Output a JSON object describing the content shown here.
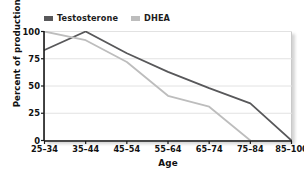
{
  "chart_data": {
    "type": "line",
    "title": "",
    "xlabel": "Age",
    "ylabel": "Percent of production in men",
    "categories": [
      "25–34",
      "35–44",
      "45–54",
      "55–64",
      "65–74",
      "75–84",
      "85–100"
    ],
    "yticks": [
      0,
      25,
      50,
      75,
      100
    ],
    "ylim": [
      0,
      100
    ],
    "grid": true,
    "legend_position": "top-left",
    "series": [
      {
        "name": "Testosterone",
        "color": "#58585a",
        "values": [
          83,
          100,
          80,
          63,
          48,
          34,
          0
        ]
      },
      {
        "name": "DHEA",
        "color": "#bdbdbd",
        "values": [
          100,
          92,
          72,
          41,
          31,
          0,
          null
        ]
      }
    ]
  },
  "legend": {
    "items": [
      {
        "label": "Testosterone",
        "swatch_icon": "legend-swatch-icon"
      },
      {
        "label": "DHEA",
        "swatch_icon": "legend-swatch-icon"
      }
    ]
  },
  "axes": {
    "y_title": "Percent of production in men",
    "x_title": "Age",
    "y_tick_labels": [
      "100",
      "75",
      "50",
      "25",
      "0"
    ],
    "x_tick_labels": [
      "25–34",
      "35–44",
      "45–54",
      "55–64",
      "65–74",
      "75–84",
      "85–100"
    ]
  },
  "colors": {
    "testosterone": "#58585a",
    "dhea": "#bdbdbd",
    "grid": "#e2e2e2",
    "frame": "#c9c9c9",
    "axis": "#1a1a1a",
    "text": "#111111",
    "background": "#ffffff"
  }
}
